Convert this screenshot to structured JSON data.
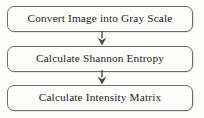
{
  "diagram": {
    "type": "flowchart",
    "orientation": "vertical",
    "colors": {
      "background": "#fdfdfb",
      "node_border": "#6e6e6e",
      "node_fill": "#fdfdfb",
      "text": "#1d1d1d",
      "arrow": "#4a4a4a"
    },
    "nodes": [
      {
        "id": "step-1",
        "label": "Convert Image into Gray Scale",
        "shape": "rounded-rectangle"
      },
      {
        "id": "step-2",
        "label": "Calculate Shannon Entropy",
        "shape": "rounded-rectangle"
      },
      {
        "id": "step-3",
        "label": "Calculate Intensity Matrix",
        "shape": "rounded-rectangle"
      }
    ],
    "connectors": [
      {
        "id": "arrow-1",
        "from": "step-1",
        "to": "step-2",
        "icon": "arrow-down-icon"
      },
      {
        "id": "arrow-2",
        "from": "step-2",
        "to": "step-3",
        "icon": "arrow-down-icon"
      }
    ]
  }
}
